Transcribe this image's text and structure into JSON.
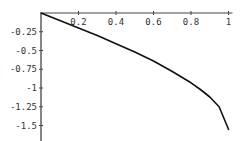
{
  "chart_data": {
    "type": "line",
    "title": "",
    "xlabel": "",
    "ylabel": "",
    "xlim": [
      0,
      1
    ],
    "ylim": [
      -1.6,
      0
    ],
    "grid": false,
    "legend": null,
    "x_ticks": [
      "0.2",
      "0.4",
      "0.6",
      "0.8",
      "1"
    ],
    "x_tick_values": [
      0.2,
      0.4,
      0.6,
      0.8,
      1.0
    ],
    "y_ticks": [
      "-0.25",
      "-0.5",
      "-0.75",
      "-1",
      "-1.25",
      "-1.5"
    ],
    "y_tick_values": [
      -0.25,
      -0.5,
      -0.75,
      -1.0,
      -1.25,
      -1.5
    ],
    "series": [
      {
        "name": "curve",
        "color": "#111111",
        "x": [
          0,
          0.1,
          0.2,
          0.3,
          0.4,
          0.5,
          0.6,
          0.7,
          0.8,
          0.85,
          0.9,
          0.95,
          1.0
        ],
        "y": [
          0,
          -0.1,
          -0.2,
          -0.3,
          -0.41,
          -0.52,
          -0.64,
          -0.78,
          -0.93,
          -1.02,
          -1.12,
          -1.25,
          -1.55
        ]
      }
    ]
  }
}
